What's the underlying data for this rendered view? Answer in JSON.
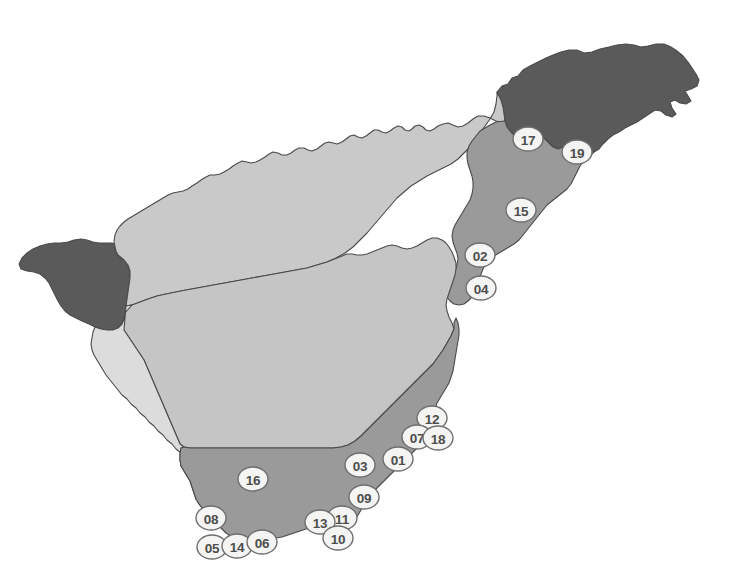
{
  "map": {
    "title": "Tenerife island zone map",
    "background_color": "#ffffff",
    "outline_color": "#4a4a4a",
    "width": 733,
    "height": 583,
    "regions": [
      {
        "id": "region-north-dark-east",
        "name": "Anaga (northeast dark massif)",
        "fill": "#5a5a5a",
        "tone": "dark"
      },
      {
        "id": "region-northwest-dark",
        "name": "Teno (northwest dark massif)",
        "fill": "#5a5a5a",
        "tone": "dark"
      },
      {
        "id": "region-north-light",
        "name": "North slope",
        "fill": "#c9c9c9",
        "tone": "light"
      },
      {
        "id": "region-central-light",
        "name": "Central massif",
        "fill": "#c5c5c5",
        "tone": "light"
      },
      {
        "id": "region-southwest-lightest",
        "name": "Southwest slope",
        "fill": "#dcdcdc",
        "tone": "lightest"
      },
      {
        "id": "region-south-medium",
        "name": "South and east coastal belt",
        "fill": "#9a9a9a",
        "tone": "medium"
      },
      {
        "id": "region-northeast-medium",
        "name": "Northeast coastal belt",
        "fill": "#9a9a9a",
        "tone": "medium"
      }
    ],
    "markers": [
      {
        "label": "17",
        "x": 528,
        "y": 139
      },
      {
        "label": "19",
        "x": 577,
        "y": 152
      },
      {
        "label": "15",
        "x": 521,
        "y": 210
      },
      {
        "label": "02",
        "x": 480,
        "y": 255
      },
      {
        "label": "04",
        "x": 481,
        "y": 288
      },
      {
        "label": "12",
        "x": 432,
        "y": 418
      },
      {
        "label": "07",
        "x": 417,
        "y": 437
      },
      {
        "label": "18",
        "x": 438,
        "y": 438
      },
      {
        "label": "01",
        "x": 398,
        "y": 459
      },
      {
        "label": "03",
        "x": 360,
        "y": 465
      },
      {
        "label": "09",
        "x": 364,
        "y": 497
      },
      {
        "label": "11",
        "x": 342,
        "y": 518
      },
      {
        "label": "13",
        "x": 320,
        "y": 522
      },
      {
        "label": "10",
        "x": 338,
        "y": 538
      },
      {
        "label": "16",
        "x": 253,
        "y": 479
      },
      {
        "label": "08",
        "x": 211,
        "y": 518
      },
      {
        "label": "05",
        "x": 212,
        "y": 547
      },
      {
        "label": "14",
        "x": 237,
        "y": 546
      },
      {
        "label": "06",
        "x": 262,
        "y": 542
      }
    ],
    "marker_style": {
      "fill": "#f4f4f2",
      "stroke": "#6e6e6e",
      "text_color": "#4d4d4d",
      "rx": 15,
      "ry": 12
    }
  }
}
